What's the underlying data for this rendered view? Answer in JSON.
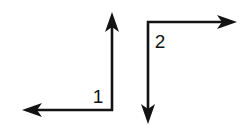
{
  "figure": {
    "background_color": "#ffffff",
    "stroke_color": "#131313",
    "line_width_px": 2.6
  },
  "arrows": [
    {
      "id": "arrow-1",
      "label": "1",
      "label_x": 98,
      "label_y": 103,
      "shape": "bent-L",
      "description": "vertical segment pointing up, horizontal segment pointing left",
      "polyline": "112,19 112,110 31,110",
      "heads": [
        {
          "id": "arrow-1-head-up",
          "direction": "up",
          "tip_x": 112,
          "tip_y": 12,
          "points": "112,12 119,32 112,27 105,32"
        },
        {
          "id": "arrow-1-head-left",
          "direction": "left",
          "tip_x": 22,
          "tip_y": 110,
          "points": "22,110 42,103 37,110 42,117"
        }
      ]
    },
    {
      "id": "arrow-2",
      "label": "2",
      "label_x": 160,
      "label_y": 48,
      "shape": "bent-L",
      "description": "horizontal segment pointing right, vertical segment pointing down",
      "polyline": "228,22 148,22 148,116",
      "heads": [
        {
          "id": "arrow-2-head-right",
          "direction": "right",
          "tip_x": 237,
          "tip_y": 22,
          "points": "237,22 217,15 222,22 217,29"
        },
        {
          "id": "arrow-2-head-down",
          "direction": "down",
          "tip_x": 148,
          "tip_y": 124,
          "points": "148,124 141,104 148,109 155,104"
        }
      ]
    }
  ]
}
